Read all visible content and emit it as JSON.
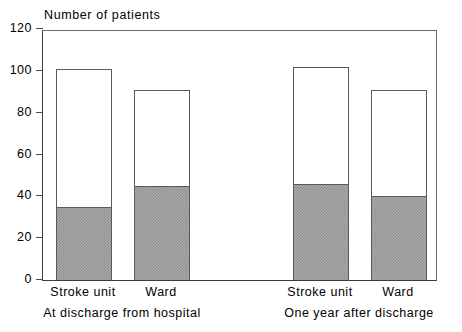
{
  "chart_data": {
    "type": "bar",
    "title": "",
    "ylabel": "Number of patients",
    "xlabel": "",
    "ylim": [
      0,
      120
    ],
    "yticks": [
      0,
      20,
      40,
      60,
      80,
      100,
      120
    ],
    "ytick_labels": [
      "0",
      "20",
      "40",
      "60",
      "80",
      "100",
      "120"
    ],
    "grid": false,
    "legend": "none",
    "stacked": true,
    "categories": [
      "Stroke unit",
      "Ward",
      "Stroke unit",
      "Ward"
    ],
    "groups": [
      {
        "label": "At discharge from hospital",
        "categories": [
          "Stroke unit",
          "Ward"
        ]
      },
      {
        "label": "One year after discharge",
        "categories": [
          "Stroke unit",
          "Ward"
        ]
      }
    ],
    "series": [
      {
        "name": "Shaded (lower segment)",
        "values": [
          35,
          45,
          46,
          40
        ]
      },
      {
        "name": "Total (bar height)",
        "values": [
          101,
          91,
          102,
          91
        ]
      }
    ],
    "bars": [
      {
        "group": "At discharge from hospital",
        "category": "Stroke unit",
        "total": 101,
        "shaded": 35
      },
      {
        "group": "At discharge from hospital",
        "category": "Ward",
        "total": 91,
        "shaded": 45
      },
      {
        "group": "One year after discharge",
        "category": "Stroke unit",
        "total": 102,
        "shaded": 46
      },
      {
        "group": "One year after discharge",
        "category": "Ward",
        "total": 91,
        "shaded": 40
      }
    ],
    "colors": {
      "shaded_fill": "#a9a9a9",
      "shaded_pattern": "#8e8e8e",
      "unshaded_fill": "#ffffff",
      "outline": "#5a5a5a",
      "axis": "#3a3a3a",
      "text": "#000000",
      "background": "#ffffff"
    }
  },
  "axis": {
    "title": "Number of patients",
    "ticks": [
      {
        "value": 0,
        "label": "0"
      },
      {
        "value": 20,
        "label": "20"
      },
      {
        "value": 40,
        "label": "40"
      },
      {
        "value": 60,
        "label": "60"
      },
      {
        "value": 80,
        "label": "80"
      },
      {
        "value": 100,
        "label": "100"
      },
      {
        "value": 120,
        "label": "120"
      }
    ]
  },
  "categories": [
    {
      "label": "Stroke unit"
    },
    {
      "label": "Ward"
    },
    {
      "label": "Stroke unit"
    },
    {
      "label": "Ward"
    }
  ],
  "groups": [
    {
      "label": "At discharge from hospital"
    },
    {
      "label": "One year after discharge"
    }
  ]
}
